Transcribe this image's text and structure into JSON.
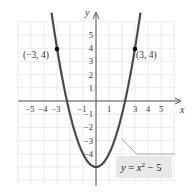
{
  "chart_data": {
    "type": "line",
    "title": "",
    "function": "y = x^2 - 5",
    "xlabel": "x",
    "ylabel": "y",
    "xlim": [
      -6,
      6
    ],
    "ylim": [
      -6,
      6.5
    ],
    "grid": true,
    "x_tick_labels": [
      "-5",
      "-4",
      "-3",
      "-1",
      "1",
      "3",
      "4",
      "5"
    ],
    "x_tick_values": [
      -5,
      -4,
      -3,
      -1,
      1,
      3,
      4,
      5
    ],
    "y_tick_labels": [
      "5",
      "4",
      "3",
      "2",
      "1",
      "-1",
      "-2",
      "-3",
      "-4"
    ],
    "y_tick_values": [
      5,
      4,
      3,
      2,
      1,
      -1,
      -2,
      -3,
      -4
    ],
    "series": [
      {
        "name": "y = x^2 - 5",
        "x": [
          -3.4,
          -3,
          -2.5,
          -2,
          -1.5,
          -1,
          -0.5,
          0,
          0.5,
          1,
          1.5,
          2,
          2.5,
          3,
          3.4
        ],
        "y": [
          6.56,
          4,
          1.25,
          -1,
          -2.75,
          -4,
          -4.75,
          -5,
          -4.75,
          -4,
          -2.75,
          -1,
          1.25,
          4,
          6.56
        ]
      }
    ],
    "points": [
      {
        "x": -3,
        "y": 4,
        "label": "(−3, 4)"
      },
      {
        "x": 3,
        "y": 4,
        "label": "(3, 4)"
      }
    ],
    "annotations": [
      {
        "text": "y = x² − 5",
        "type": "callout-box"
      }
    ]
  },
  "labels": {
    "x_axis": "x",
    "y_axis": "y",
    "point_left": "(−3, 4)",
    "point_right": "(3, 4)",
    "equation_y": "y",
    "equation_eq": " = ",
    "equation_x": "x",
    "equation_exp": "2",
    "equation_rest": " − 5"
  },
  "colors": {
    "curve": "#4a4a4a",
    "grid": "#e4e4e4",
    "axis": "#555555",
    "callout_box": "#e8e8e8"
  }
}
